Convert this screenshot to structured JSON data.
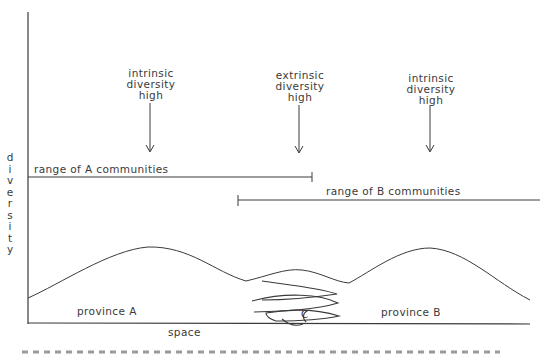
{
  "diagram": {
    "y_axis_label": [
      "d",
      "i",
      "v",
      "e",
      "r",
      "s",
      "i",
      "t",
      "y"
    ],
    "x_axis_label": "space",
    "annotations": [
      {
        "id": "arrow-1",
        "lines": [
          "intrinsic",
          "diversity",
          "high"
        ]
      },
      {
        "id": "arrow-2",
        "lines": [
          "extrinsic",
          "diversity",
          "high"
        ]
      },
      {
        "id": "arrow-3",
        "lines": [
          "intrinsic",
          "diversity",
          "high"
        ]
      }
    ],
    "ranges": {
      "a_label": "range of A communities",
      "b_label": "range of B communities"
    },
    "regions": {
      "province_a": "province A",
      "province_b": "province B",
      "center_marker": "C"
    },
    "caption_visible": "(caption text cut off at bottom edge)"
  },
  "colors": {
    "ink": "#3a3a3a",
    "background": "#ffffff"
  }
}
